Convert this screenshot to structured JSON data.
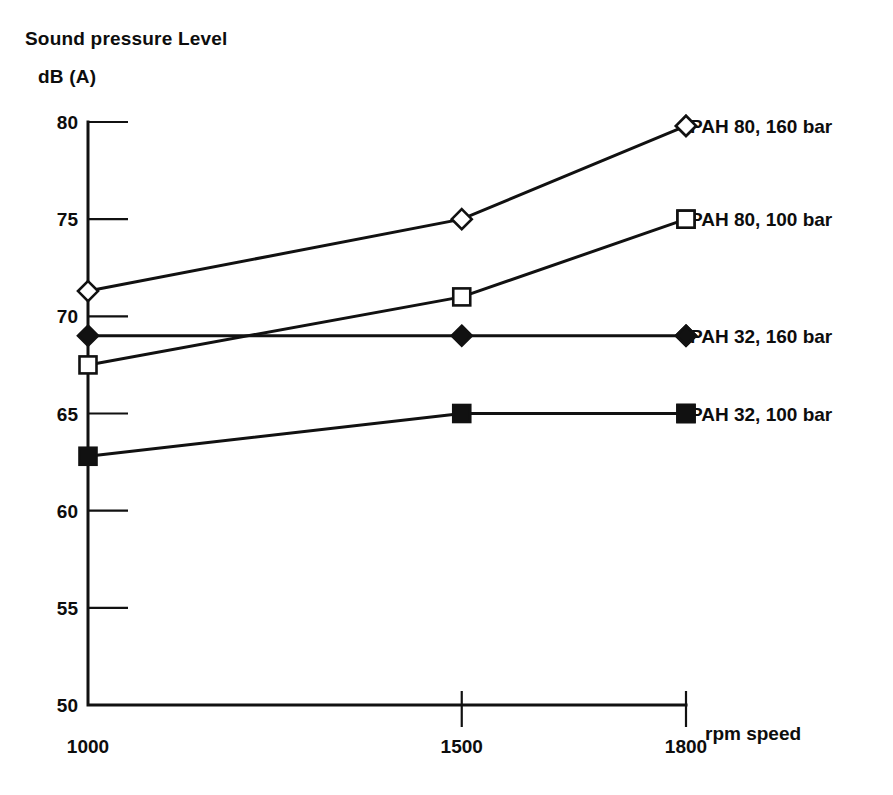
{
  "axis_titles": {
    "y_line1": "Sound pressure Level",
    "y_line2": "dB (A)",
    "x_name": "rpm speed"
  },
  "chart_data": {
    "type": "line",
    "title": "Sound pressure Level dB (A)",
    "xlabel": "rpm speed",
    "ylabel": "Sound pressure Level dB (A)",
    "x": [
      1000,
      1500,
      1800
    ],
    "xtick_labels": [
      "1000",
      "1500",
      "1800"
    ],
    "xlim": [
      1000,
      1800
    ],
    "ytick_labels": [
      "80",
      "75",
      "70",
      "65",
      "60",
      "55",
      "50"
    ],
    "yticks": [
      80,
      75,
      70,
      65,
      60,
      55,
      50
    ],
    "ylim": [
      50,
      80
    ],
    "grid": false,
    "legend_position": "right-inline",
    "series": [
      {
        "name": "PAH 80, 160 bar",
        "marker": "open-diamond",
        "values": [
          71.3,
          75.0,
          79.8
        ]
      },
      {
        "name": "PAH 80, 100 bar",
        "marker": "open-square",
        "values": [
          67.5,
          71.0,
          75.0
        ]
      },
      {
        "name": "PAH 32, 160 bar",
        "marker": "filled-diamond",
        "values": [
          69.0,
          69.0,
          69.0
        ]
      },
      {
        "name": "PAH 32, 100 bar",
        "marker": "filled-square",
        "values": [
          62.8,
          65.0,
          65.0
        ]
      }
    ]
  },
  "colors": {
    "ink": "#111111",
    "background": "#ffffff"
  }
}
